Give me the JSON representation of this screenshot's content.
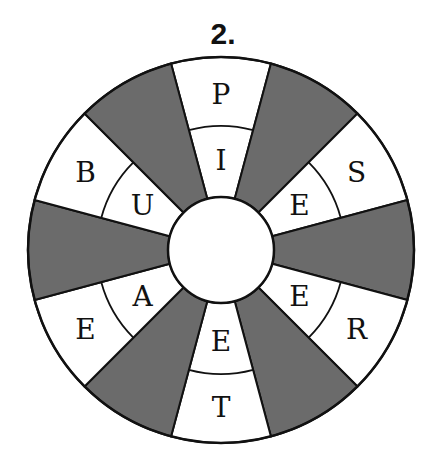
{
  "title": "2.",
  "wheel": {
    "center": [
      221,
      250
    ],
    "outer_radius": 193,
    "middle_radius": 124,
    "inner_radius": 53,
    "sector_count": 12,
    "colors": {
      "shaded": "#6b6b6b",
      "blank": "#ffffff",
      "stroke": "#111111"
    },
    "sectors": [
      {
        "angle": 0,
        "shaded": false,
        "outer": "P",
        "inner": "I"
      },
      {
        "angle": 30,
        "shaded": true,
        "outer": "",
        "inner": ""
      },
      {
        "angle": 60,
        "shaded": false,
        "outer": "S",
        "inner": "E"
      },
      {
        "angle": 90,
        "shaded": true,
        "outer": "",
        "inner": ""
      },
      {
        "angle": 120,
        "shaded": false,
        "outer": "R",
        "inner": "E"
      },
      {
        "angle": 150,
        "shaded": true,
        "outer": "",
        "inner": ""
      },
      {
        "angle": 180,
        "shaded": false,
        "outer": "T",
        "inner": "E"
      },
      {
        "angle": 210,
        "shaded": true,
        "outer": "",
        "inner": ""
      },
      {
        "angle": 240,
        "shaded": false,
        "outer": "E",
        "inner": "A"
      },
      {
        "angle": 270,
        "shaded": true,
        "outer": "",
        "inner": ""
      },
      {
        "angle": 300,
        "shaded": false,
        "outer": "B",
        "inner": "U"
      },
      {
        "angle": 330,
        "shaded": true,
        "outer": "",
        "inner": ""
      }
    ]
  }
}
